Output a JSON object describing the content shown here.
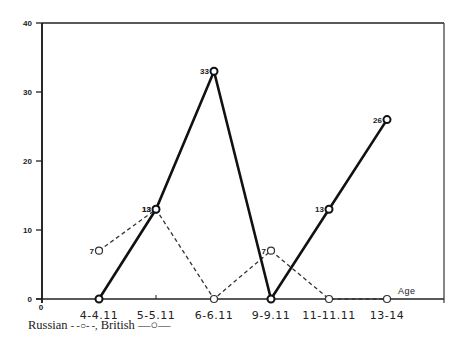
{
  "chart_data": {
    "type": "line",
    "title": "",
    "xlabel": "Age",
    "ylabel": "",
    "ylim": [
      0,
      40
    ],
    "yticks": [
      0,
      10,
      20,
      30,
      40
    ],
    "origin_label": "0",
    "grid": false,
    "categories": [
      "4-4.11",
      "5-5.11",
      "6-6.11",
      "9-9.11",
      "11-11.11",
      "13-14"
    ],
    "series": [
      {
        "name": "Russian",
        "style": "dashed",
        "marker": "open-circle",
        "values": [
          7,
          13,
          0,
          7,
          0,
          0
        ],
        "labels": [
          "7",
          "13",
          "",
          "7",
          "",
          ""
        ]
      },
      {
        "name": "British",
        "style": "solid",
        "marker": "open-circle",
        "values": [
          0,
          13,
          33,
          0,
          13,
          26
        ],
        "labels": [
          "",
          "13",
          "33",
          "",
          "13",
          "26"
        ]
      }
    ],
    "legend": {
      "position": "bottom-left",
      "text": "Russian - -○- -, British —○—"
    }
  },
  "legend": {
    "russian_label": "Russian",
    "russian_glyph": "- -○- -,",
    "british_label": "British",
    "british_glyph": "—○—"
  }
}
